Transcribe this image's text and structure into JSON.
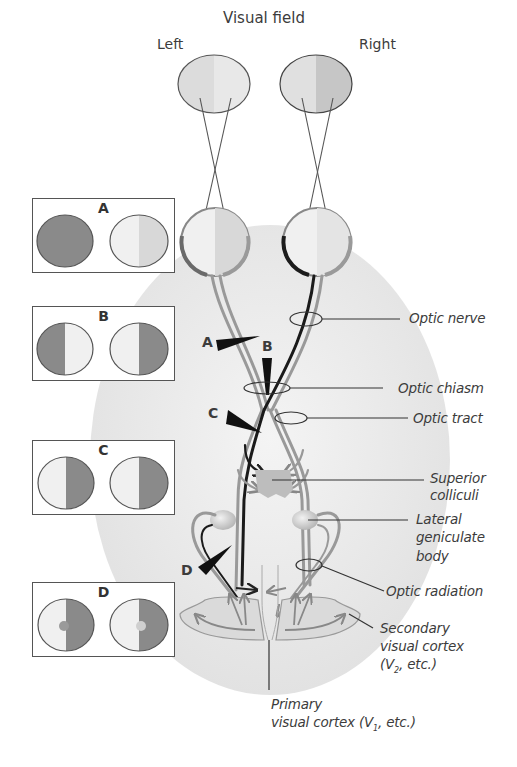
{
  "title": "Visual field",
  "eye_labels": {
    "left": "Left",
    "right": "Right"
  },
  "lesion_boxes": [
    {
      "letter": "A",
      "left_eye": "fully darkened (blind)",
      "right_eye": "normal"
    },
    {
      "letter": "B",
      "left_eye": "temporal half darkened",
      "right_eye": "temporal half darkened"
    },
    {
      "letter": "C",
      "left_eye": "right half darkened",
      "right_eye": "right half darkened"
    },
    {
      "letter": "D",
      "left_eye": "right half darkened, macular sparing",
      "right_eye": "right half darkened, macular sparing"
    }
  ],
  "lesion_markers": [
    "A",
    "B",
    "C",
    "D"
  ],
  "structures": {
    "optic_nerve": "Optic nerve",
    "optic_chiasm": "Optic chiasm",
    "optic_tract": "Optic tract",
    "superior_colliculi_1": "Superior",
    "superior_colliculi_2": "colliculi",
    "lgb_1": "Lateral",
    "lgb_2": "geniculate",
    "lgb_3": "body",
    "optic_radiation": "Optic radiation",
    "secondary_1": "Secondary",
    "secondary_2": "visual cortex",
    "secondary_3_pre": "(V",
    "secondary_3_sub": "2",
    "secondary_3_post": ", etc.)",
    "primary_1": "Primary",
    "primary_2_pre": "visual cortex (V",
    "primary_2_sub": "1",
    "primary_2_post": ", etc.)"
  },
  "colors": {
    "dark_field": "#8a8a8a",
    "light_field": "#e6e6e6",
    "nerve_gray": "#9a9a9a",
    "nerve_black": "#1a1a1a",
    "background_ellipse": "#ececec",
    "leader_line": "#333333"
  }
}
